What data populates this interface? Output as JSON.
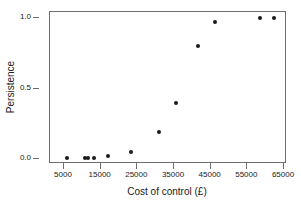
{
  "chart_data": {
    "type": "scatter",
    "title": "",
    "xlabel": "Cost of control (£)",
    "ylabel": "Persistence",
    "xlim": [
      3000,
      67000
    ],
    "ylim": [
      -0.05,
      1.05
    ],
    "grid": false,
    "legend": null,
    "xticks": [
      5000,
      15000,
      25000,
      35000,
      45000,
      55000,
      65000
    ],
    "xtick_labels": [
      "5000",
      "15000",
      "25000",
      "35000",
      "45000",
      "55000",
      "65000"
    ],
    "yticks": [
      0.0,
      0.5,
      1.0
    ],
    "ytick_labels": [
      "0.0",
      "0.5",
      "1.0"
    ],
    "marker": "filled-circle",
    "marker_color": "#1a1a1a",
    "x": [
      5800,
      10800,
      11600,
      13200,
      17000,
      23300,
      31000,
      35500,
      41500,
      46200,
      58400,
      62200
    ],
    "y": [
      0.01,
      0.01,
      0.01,
      0.01,
      0.02,
      0.05,
      0.19,
      0.4,
      0.8,
      0.97,
      1.0,
      1.0
    ],
    "points": [
      {
        "x": 5800,
        "y": 0.01
      },
      {
        "x": 10800,
        "y": 0.01
      },
      {
        "x": 11600,
        "y": 0.01
      },
      {
        "x": 13200,
        "y": 0.01
      },
      {
        "x": 17000,
        "y": 0.02
      },
      {
        "x": 23300,
        "y": 0.05
      },
      {
        "x": 31000,
        "y": 0.19
      },
      {
        "x": 35500,
        "y": 0.4
      },
      {
        "x": 41500,
        "y": 0.8
      },
      {
        "x": 46200,
        "y": 0.97
      },
      {
        "x": 58400,
        "y": 1.0
      },
      {
        "x": 62200,
        "y": 1.0
      }
    ]
  },
  "colors": {
    "background": "#ffffff",
    "frame": "#6e6e6e",
    "text": "#1a1a1a",
    "marker": "#1a1a1a"
  }
}
